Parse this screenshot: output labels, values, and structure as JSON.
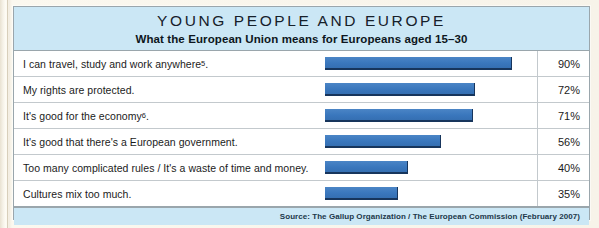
{
  "chart_data": {
    "type": "bar",
    "orientation": "horizontal",
    "title": "YOUNG PEOPLE AND EUROPE",
    "subtitle": "What the European Union means for Europeans aged 15–30",
    "xlabel": "",
    "ylabel": "",
    "xlim": [
      0,
      100
    ],
    "grid": false,
    "legend": null,
    "value_suffix": "%",
    "bar_color": "#3a77bd",
    "bar_edge_color": "#17355c",
    "header_color": "#cbe7f5",
    "categories": [
      "I can travel, study and work anywhere5.",
      "My rights are protected.",
      "It's good for the economy6.",
      "It's good that there's a European government.",
      "Too many complicated rules / It's a waste of time and money.",
      "Cultures mix too much."
    ],
    "values": [
      90,
      72,
      71,
      56,
      40,
      35
    ],
    "rows": [
      {
        "label_main": "I can travel, study and work anywhere",
        "label_sup": "5",
        "label_tail": ".",
        "value": 90,
        "value_label": "90%"
      },
      {
        "label_main": "My rights are protected.",
        "label_sup": "",
        "label_tail": "",
        "value": 72,
        "value_label": "72%"
      },
      {
        "label_main": "It's good for the economy",
        "label_sup": "6",
        "label_tail": ".",
        "value": 71,
        "value_label": "71%"
      },
      {
        "label_main": "It's good that there's a European government.",
        "label_sup": "",
        "label_tail": "",
        "value": 56,
        "value_label": "56%"
      },
      {
        "label_main": "Too many complicated rules / It's a waste of time and money.",
        "label_sup": "",
        "label_tail": "",
        "value": 40,
        "value_label": "40%"
      },
      {
        "label_main": "Cultures mix too much.",
        "label_sup": "",
        "label_tail": "",
        "value": 35,
        "value_label": "35%"
      }
    ],
    "annotations": {
      "source": "Source: The Gallup Organization / The European Commission (February 2007)"
    }
  }
}
